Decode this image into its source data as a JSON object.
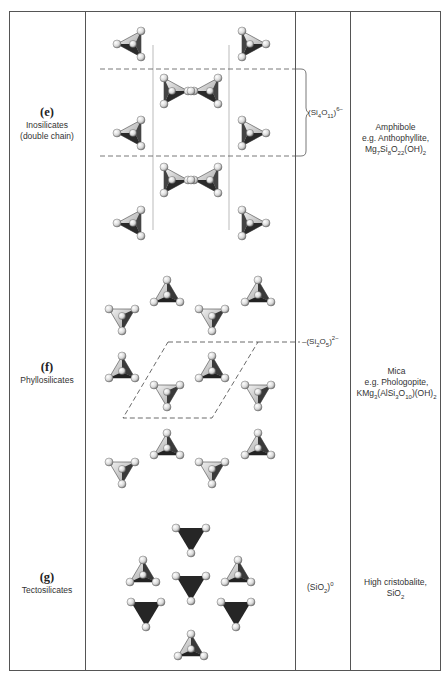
{
  "rows": [
    {
      "letter": "(e)",
      "class": "Inosilicates",
      "subclass": "(double chain)",
      "unit": {
        "prefix": "(Si",
        "s1": "4",
        "mid": "O",
        "s2": "11",
        "suffix": ")",
        "charge": "6−"
      },
      "mineral": {
        "group": "Amphibole",
        "example": "e.g. Anthophyllite,",
        "f1": "Mg",
        "f1s": "7",
        "f2": "Si",
        "f2s": "8",
        "f3": "O",
        "f3s": "22",
        "f4": "(OH)",
        "f4s": "2"
      }
    },
    {
      "letter": "(f)",
      "class": "Phyllosilicates",
      "unit": {
        "prefix": "(Si",
        "s1": "2",
        "mid": "O",
        "s2": "5",
        "suffix": ")",
        "charge": "2−"
      },
      "mineral": {
        "group": "Mica",
        "example": "e.g. Phologopite,",
        "f1": "KMg",
        "f1s": "3",
        "f2": "(AlSi",
        "f2s": "3",
        "f3": "O",
        "f3s": "10",
        "f4": ")(OH)",
        "f4s": "2"
      }
    },
    {
      "letter": "(g)",
      "class": "Tectosilicates",
      "unit": {
        "prefix": "(SiO",
        "s1": "2",
        "suffix": ")",
        "charge": "0"
      },
      "mineral": {
        "group": "High cristobalite,",
        "f1": "SiO",
        "f1s": "2"
      }
    }
  ],
  "colors": {
    "line": "#555555",
    "tet_dark": "#2b2b2b",
    "tet_light": "#d8d8d8",
    "atom": "#e6e6e6"
  }
}
